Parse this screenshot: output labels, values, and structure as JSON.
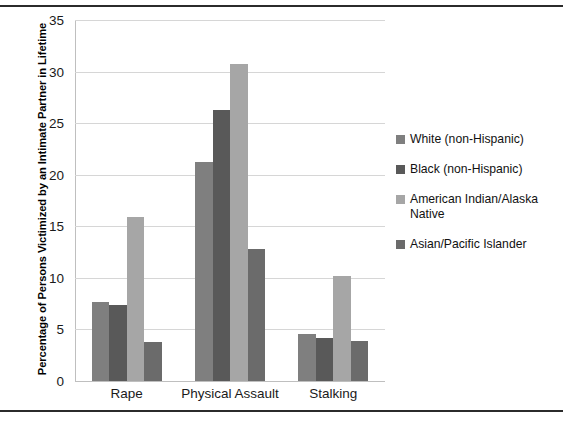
{
  "chart_data": {
    "type": "bar",
    "title": "",
    "subtitle": "",
    "xlabel": "",
    "ylabel": "Percentage of Persons Victimized by an Intimate Partner in Lifetime",
    "categories": [
      "Rape",
      "Physical Assault",
      "Stalking"
    ],
    "series": [
      {
        "name": "White (non-Hispanic)",
        "color": "#7f7f7f",
        "values": [
          7.7,
          21.2,
          4.6
        ]
      },
      {
        "name": "Black (non-Hispanic)",
        "color": "#595959",
        "values": [
          7.4,
          26.3,
          4.2
        ]
      },
      {
        "name": "American Indian/Alaska Native",
        "color": "#a6a6a6",
        "values": [
          15.9,
          30.7,
          10.2
        ]
      },
      {
        "name": "Asian/Pacific Islander",
        "color": "#6b6b6b",
        "values": [
          3.8,
          12.8,
          3.9
        ]
      }
    ],
    "ylim": [
      0,
      35
    ],
    "yticks": [
      0,
      5,
      10,
      15,
      20,
      25,
      30,
      35
    ],
    "ytick_labels": [
      "0",
      "5",
      "10",
      "15",
      "20",
      "25",
      "30",
      "35"
    ],
    "grid": true,
    "grid_axis": "y",
    "grid_color": "#d6d6d6",
    "legend_position": "right",
    "background": "#ffffff",
    "border_color": "#2b2b2b"
  },
  "legend": {
    "items": [
      {
        "label": "White (non-Hispanic)"
      },
      {
        "label": "Black (non-Hispanic)"
      },
      {
        "label": "American Indian/Alaska\nNative"
      },
      {
        "label": "Asian/Pacific Islander"
      }
    ]
  }
}
